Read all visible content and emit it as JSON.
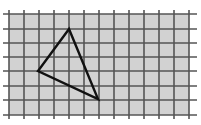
{
  "diagram": {
    "type": "grid-with-triangle",
    "background": "#ffffff",
    "grid": {
      "fill": "#d2d2d2",
      "line_color": "#555555",
      "line_width": 1.6,
      "x_lines": [
        9,
        24,
        39,
        54,
        69,
        84,
        99,
        114,
        129,
        144,
        159,
        174,
        189
      ],
      "y_lines": [
        14,
        29,
        43,
        57,
        71,
        86,
        100,
        115
      ],
      "x_extent": [
        3,
        197
      ],
      "y_extent": [
        10,
        119
      ]
    },
    "triangle": {
      "stroke": "#111111",
      "stroke_width": 2.4,
      "vertices": [
        {
          "name": "top",
          "x": 69,
          "y": 29
        },
        {
          "name": "left",
          "x": 38,
          "y": 71
        },
        {
          "name": "bottom-right",
          "x": 98,
          "y": 99
        }
      ]
    }
  }
}
